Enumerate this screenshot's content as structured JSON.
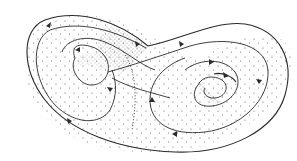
{
  "figure": {
    "style": "stippled line drawing",
    "colors": {
      "background": "#ffffff",
      "ink": "#2a2a2a",
      "stipple": "#555555"
    },
    "lobes": [
      {
        "name": "left-lobe",
        "center": [
          95,
          70
        ]
      },
      {
        "name": "right-lobe",
        "center": [
          213,
          88
        ]
      }
    ]
  }
}
